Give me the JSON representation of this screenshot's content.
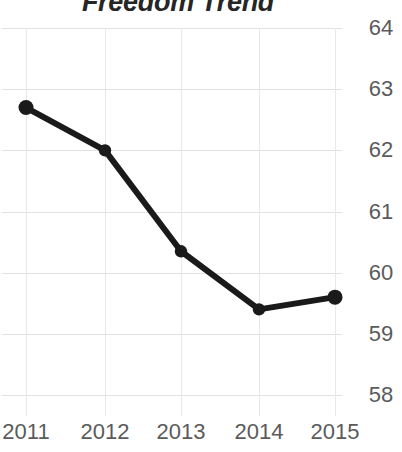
{
  "chart_data": {
    "type": "line",
    "title": "Freedom Trend",
    "xlabel": "",
    "ylabel": "",
    "categories": [
      "2011",
      "2012",
      "2013",
      "2014",
      "2015"
    ],
    "x": [
      2011,
      2012,
      2013,
      2014,
      2015
    ],
    "values": [
      62.7,
      62.0,
      60.35,
      59.4,
      59.6
    ],
    "series": [
      {
        "name": "Freedom Trend",
        "values": [
          62.7,
          62.0,
          60.35,
          59.4,
          59.6
        ],
        "color": "#1a1a1a",
        "marker": "circle",
        "line_width": 6
      }
    ],
    "ylim": [
      58,
      64
    ],
    "yticks": [
      58,
      59,
      60,
      61,
      62,
      63,
      64
    ],
    "ytick_labels": [
      "58",
      "59",
      "60",
      "61",
      "62",
      "63",
      "64"
    ],
    "xtick_labels": [
      "2011",
      "2012",
      "2013",
      "2014",
      "2015"
    ],
    "grid": true,
    "grid_color": "#e2e2e2",
    "legend": false,
    "legend_position": "none",
    "background": "#ffffff",
    "tick_label_color": "#5b5b5b",
    "title_color": "#262626",
    "y_axis_side": "right"
  }
}
